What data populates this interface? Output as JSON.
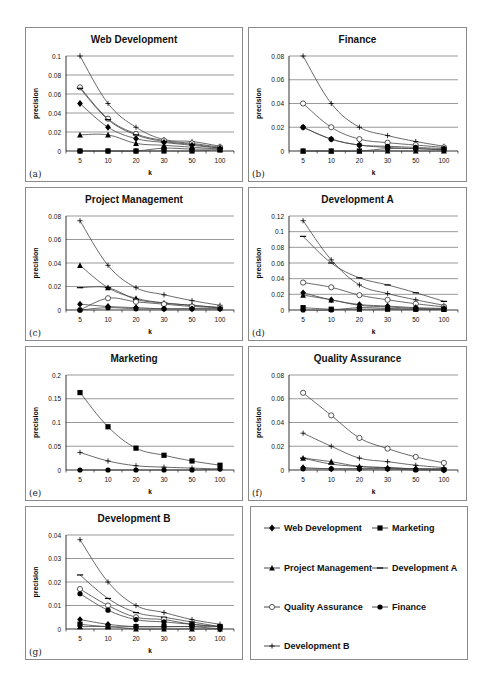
{
  "figure": {
    "x_axis_label": "k",
    "y_axis_label": "precision",
    "series_styles": {
      "Web Development": {
        "marker": "diamond",
        "color": "#000000"
      },
      "Marketing": {
        "marker": "square",
        "color": "#000000"
      },
      "Project Management": {
        "marker": "triangle",
        "color": "#000000"
      },
      "Development A": {
        "marker": "dash",
        "color": "#000000"
      },
      "Quality Assurance": {
        "marker": "circle-open",
        "color": "#000000"
      },
      "Finance": {
        "marker": "circle-filled",
        "color": "#000000"
      },
      "Development B": {
        "marker": "plus",
        "color": "#000000"
      }
    }
  },
  "legend": {
    "items": [
      {
        "label": "Web Development",
        "marker": "diamond"
      },
      {
        "label": "Marketing",
        "marker": "square"
      },
      {
        "label": "Project Management",
        "marker": "triangle"
      },
      {
        "label": "Development A",
        "marker": "dash"
      },
      {
        "label": "Quality Assurance",
        "marker": "circle-open"
      },
      {
        "label": "Finance",
        "marker": "circle-filled"
      },
      {
        "label": "Development B",
        "marker": "plus"
      }
    ]
  },
  "chart_data": [
    {
      "panel": "(a)",
      "type": "line",
      "title": "Web Development",
      "xlabel": "k",
      "ylabel": "precision",
      "categories": [
        "5",
        "10",
        "20",
        "30",
        "50",
        "100"
      ],
      "yticks": [
        "0",
        "0.02",
        "0.04",
        "0.06",
        "0.08",
        "0.1"
      ],
      "ylim": [
        0,
        0.1
      ],
      "grid": true,
      "series": [
        {
          "name": "Development B",
          "values": [
            0.1,
            0.05,
            0.025,
            0.012,
            0.01,
            0.005
          ]
        },
        {
          "name": "Quality Assurance",
          "values": [
            0.067,
            0.034,
            0.018,
            0.011,
            0.008,
            0.004
          ]
        },
        {
          "name": "Development A",
          "values": [
            0.066,
            0.033,
            0.017,
            0.01,
            0.007,
            0.003
          ]
        },
        {
          "name": "Web Development",
          "values": [
            0.05,
            0.025,
            0.013,
            0.009,
            0.006,
            0.003
          ]
        },
        {
          "name": "Project Management",
          "values": [
            0.017,
            0.017,
            0.008,
            0.006,
            0.004,
            0.002
          ]
        },
        {
          "name": "Finance",
          "values": [
            0,
            0,
            0,
            0.003,
            0.002,
            0.002
          ]
        },
        {
          "name": "Marketing",
          "values": [
            0,
            0,
            0,
            0,
            0,
            0.001
          ]
        }
      ]
    },
    {
      "panel": "(b)",
      "type": "line",
      "title": "Finance",
      "xlabel": "k",
      "ylabel": "precision",
      "categories": [
        "5",
        "10",
        "20",
        "30",
        "50",
        "100"
      ],
      "yticks": [
        "0",
        "0.02",
        "0.04",
        "0.06",
        "0.08"
      ],
      "ylim": [
        0,
        0.08
      ],
      "grid": true,
      "series": [
        {
          "name": "Development B",
          "values": [
            0.08,
            0.04,
            0.02,
            0.013,
            0.008,
            0.004
          ]
        },
        {
          "name": "Quality Assurance",
          "values": [
            0.04,
            0.02,
            0.01,
            0.007,
            0.005,
            0.003
          ]
        },
        {
          "name": "Finance",
          "values": [
            0.02,
            0.01,
            0.005,
            0.004,
            0.003,
            0.002
          ]
        },
        {
          "name": "Web Development",
          "values": [
            0.02,
            0.01,
            0.005,
            0.003,
            0.002,
            0.001
          ]
        },
        {
          "name": "Marketing",
          "values": [
            0,
            0,
            0,
            0.002,
            0.002,
            0.001
          ]
        },
        {
          "name": "Project Management",
          "values": [
            0,
            0,
            0,
            0,
            0,
            0
          ]
        }
      ]
    },
    {
      "panel": "(c)",
      "type": "line",
      "title": "Project Management",
      "xlabel": "k",
      "ylabel": "precision",
      "categories": [
        "5",
        "10",
        "20",
        "30",
        "50",
        "100"
      ],
      "yticks": [
        "0",
        "0.02",
        "0.04",
        "0.06",
        "0.08"
      ],
      "ylim": [
        0,
        0.08
      ],
      "grid": true,
      "series": [
        {
          "name": "Development B",
          "values": [
            0.076,
            0.038,
            0.019,
            0.013,
            0.008,
            0.004
          ]
        },
        {
          "name": "Project Management",
          "values": [
            0.038,
            0.019,
            0.01,
            0.006,
            0.004,
            0.002
          ]
        },
        {
          "name": "Development A",
          "values": [
            0.019,
            0.019,
            0.009,
            0.006,
            0.004,
            0.002
          ]
        },
        {
          "name": "Quality Assurance",
          "values": [
            0,
            0.01,
            0.007,
            0.005,
            0.003,
            0.002
          ]
        },
        {
          "name": "Web Development",
          "values": [
            0.005,
            0.003,
            0.002,
            0.001,
            0.001,
            0.001
          ]
        },
        {
          "name": "Finance",
          "values": [
            0,
            0.002,
            0.001,
            0.001,
            0.001,
            0.001
          ]
        }
      ]
    },
    {
      "panel": "(d)",
      "type": "line",
      "title": "Development A",
      "xlabel": "k",
      "ylabel": "precision",
      "categories": [
        "5",
        "10",
        "20",
        "30",
        "50",
        "100"
      ],
      "yticks": [
        "0",
        "0.02",
        "0.04",
        "0.06",
        "0.08",
        "0.1",
        "0.12"
      ],
      "ylim": [
        0,
        0.12
      ],
      "grid": true,
      "series": [
        {
          "name": "Development B",
          "values": [
            0.114,
            0.064,
            0.032,
            0.021,
            0.013,
            0.006
          ]
        },
        {
          "name": "Development A",
          "values": [
            0.094,
            0.06,
            0.041,
            0.032,
            0.022,
            0.011
          ]
        },
        {
          "name": "Quality Assurance",
          "values": [
            0.035,
            0.029,
            0.019,
            0.013,
            0.008,
            0.004
          ]
        },
        {
          "name": "Web Development",
          "values": [
            0.022,
            0.013,
            0.007,
            0.005,
            0.003,
            0.002
          ]
        },
        {
          "name": "Project Management",
          "values": [
            0.019,
            0.013,
            0.006,
            0.004,
            0.002,
            0.001
          ]
        },
        {
          "name": "Marketing",
          "values": [
            0.003,
            0.001,
            0.001,
            0.001,
            0.001,
            0.001
          ]
        },
        {
          "name": "Finance",
          "values": [
            0,
            0,
            0.003,
            0.002,
            0.001,
            0.001
          ]
        }
      ]
    },
    {
      "panel": "(e)",
      "type": "line",
      "title": "Marketing",
      "xlabel": "k",
      "ylabel": "precision",
      "categories": [
        "5",
        "10",
        "20",
        "30",
        "50",
        "100"
      ],
      "yticks": [
        "0",
        "0.05",
        "0.1",
        "0.15",
        "0.2"
      ],
      "ylim": [
        0,
        0.2
      ],
      "grid": true,
      "series": [
        {
          "name": "Marketing",
          "values": [
            0.163,
            0.091,
            0.046,
            0.031,
            0.019,
            0.01
          ]
        },
        {
          "name": "Development B",
          "values": [
            0.037,
            0.019,
            0.009,
            0.006,
            0.004,
            0.002
          ]
        },
        {
          "name": "Finance",
          "values": [
            0,
            0,
            0,
            0,
            0,
            0.002
          ]
        }
      ]
    },
    {
      "panel": "(f)",
      "type": "line",
      "title": "Quality Assurance",
      "xlabel": "k",
      "ylabel": "precision",
      "categories": [
        "5",
        "10",
        "20",
        "30",
        "50",
        "100"
      ],
      "yticks": [
        "0",
        "0.02",
        "0.04",
        "0.06",
        "0.08"
      ],
      "ylim": [
        0,
        0.08
      ],
      "grid": true,
      "series": [
        {
          "name": "Quality Assurance",
          "values": [
            0.065,
            0.046,
            0.027,
            0.018,
            0.011,
            0.006
          ]
        },
        {
          "name": "Development B",
          "values": [
            0.031,
            0.02,
            0.01,
            0.007,
            0.004,
            0.002
          ]
        },
        {
          "name": "Project Management",
          "values": [
            0.01,
            0.007,
            0.003,
            0.002,
            0.001,
            0.001
          ]
        },
        {
          "name": "Development A",
          "values": [
            0.01,
            0.005,
            0.003,
            0.002,
            0.001,
            0.001
          ]
        },
        {
          "name": "Web Development",
          "values": [
            0.002,
            0.001,
            0.001,
            0.001,
            0.001,
            0
          ]
        },
        {
          "name": "Finance",
          "values": [
            0.001,
            0.001,
            0.001,
            0.001,
            0,
            0
          ]
        }
      ]
    },
    {
      "panel": "(g)",
      "type": "line",
      "title": "Development B",
      "xlabel": "k",
      "ylabel": "precision",
      "categories": [
        "5",
        "10",
        "20",
        "30",
        "50",
        "100"
      ],
      "yticks": [
        "0",
        "0.01",
        "0.02",
        "0.03",
        "0.04"
      ],
      "ylim": [
        0,
        0.04
      ],
      "grid": true,
      "series": [
        {
          "name": "Development B",
          "values": [
            0.038,
            0.02,
            0.01,
            0.007,
            0.004,
            0.002
          ]
        },
        {
          "name": "Development A",
          "values": [
            0.023,
            0.013,
            0.007,
            0.005,
            0.003,
            0.001
          ]
        },
        {
          "name": "Quality Assurance",
          "values": [
            0.017,
            0.01,
            0.005,
            0.004,
            0.002,
            0.001
          ]
        },
        {
          "name": "Finance",
          "values": [
            0.015,
            0.008,
            0.004,
            0.003,
            0.002,
            0.001
          ]
        },
        {
          "name": "Web Development",
          "values": [
            0.004,
            0.002,
            0.001,
            0.001,
            0.001,
            0
          ]
        },
        {
          "name": "Marketing",
          "values": [
            0.002,
            0.001,
            0.001,
            0.001,
            0.001,
            0.001
          ]
        },
        {
          "name": "Project Management",
          "values": [
            0.001,
            0.001,
            0,
            0,
            0,
            0
          ]
        }
      ]
    }
  ]
}
